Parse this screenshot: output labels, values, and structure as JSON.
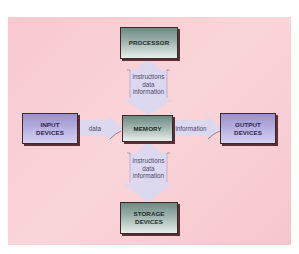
{
  "diagram": {
    "title_fragment": "",
    "nodes": {
      "processor": "PROCESSOR",
      "memory": "MEMORY",
      "input": {
        "line1": "INPUT",
        "line2": "DEVICES"
      },
      "output": {
        "line1": "OUTPUT",
        "line2": "DEVICES"
      },
      "storage": {
        "line1": "STORAGE",
        "line2": "DEVICES"
      }
    },
    "edges": {
      "processor_memory": {
        "line1": "instructions",
        "line2": "data",
        "line3": "information"
      },
      "memory_storage": {
        "line1": "instructions",
        "line2": "data",
        "line3": "information"
      },
      "input_memory": "data",
      "memory_output": "information"
    },
    "colors": {
      "background_panel": "#f8cfd5",
      "arrow_fill": "#dcd8f0",
      "gray_box": "#9fb3ad",
      "purple_box": "#b8b0e0",
      "box_shadow": "#5a2f35"
    }
  }
}
